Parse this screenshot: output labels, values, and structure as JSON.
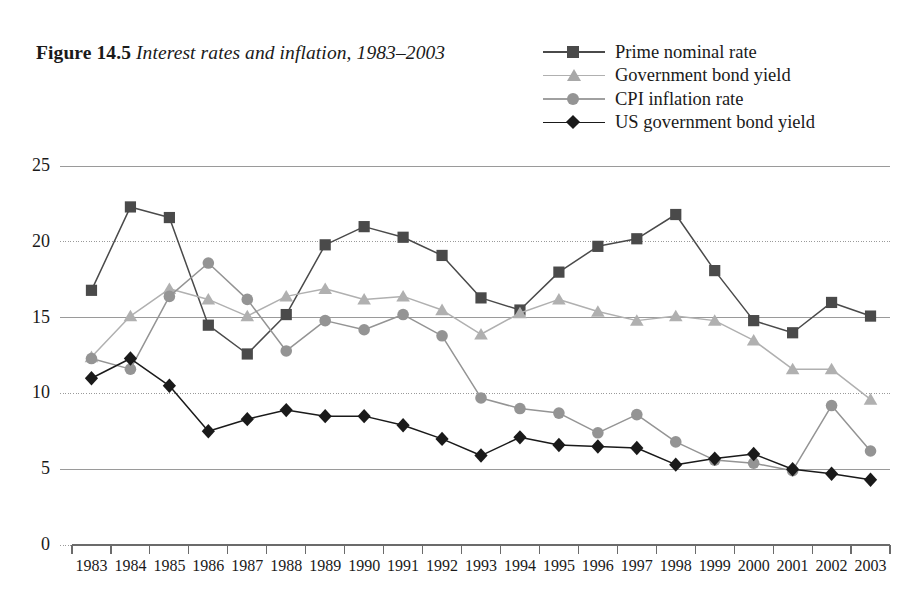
{
  "figure": {
    "number": "Figure 14.5",
    "caption": "Interest rates and inflation, 1983–2003"
  },
  "colors": {
    "prime_nominal_rate": "#4a4a4a",
    "government_bond_yield": "#b0b0b0",
    "cpi_inflation_rate": "#949494",
    "us_government_bond_yield": "#1a1a1a",
    "axis": "#6b6b6b",
    "gridline": "#9a9a9a",
    "background": "#ffffff",
    "text": "#1a1a1a"
  },
  "legend": {
    "position": "top-right",
    "entries": [
      {
        "label": "Prime nominal rate",
        "marker": "square",
        "color": "#4a4a4a"
      },
      {
        "label": "Government bond yield",
        "marker": "triangle",
        "color": "#b0b0b0"
      },
      {
        "label": "CPI inflation rate",
        "marker": "circle",
        "color": "#949494"
      },
      {
        "label": "US government bond yield",
        "marker": "diamond",
        "color": "#1a1a1a"
      }
    ]
  },
  "chart_data": {
    "type": "line",
    "xlabel": "",
    "ylabel": "",
    "grid": true,
    "legend_position": "top-right",
    "xlim": [
      1983,
      2003
    ],
    "ylim": [
      0,
      25
    ],
    "ytick_values": [
      0,
      5,
      10,
      15,
      20,
      25
    ],
    "ytick_labels": [
      "0",
      "5",
      "10",
      "15",
      "20",
      "25"
    ],
    "categories": [
      "1983",
      "1984",
      "1985",
      "1986",
      "1987",
      "1988",
      "1989",
      "1990",
      "1991",
      "1992",
      "1993",
      "1994",
      "1995",
      "1996",
      "1997",
      "1998",
      "1999",
      "2000",
      "2001",
      "2002",
      "2003"
    ],
    "series": [
      {
        "name": "Prime nominal rate",
        "marker": "square",
        "color": "#4a4a4a",
        "values": [
          16.8,
          22.3,
          21.6,
          14.5,
          12.6,
          15.2,
          19.8,
          21.0,
          20.3,
          19.1,
          16.3,
          15.5,
          18.0,
          19.7,
          20.2,
          21.8,
          18.1,
          14.8,
          14.0,
          16.0,
          15.1
        ]
      },
      {
        "name": "Government bond yield",
        "marker": "triangle",
        "color": "#b0b0b0",
        "values": [
          12.4,
          15.1,
          16.9,
          16.2,
          15.1,
          16.4,
          16.9,
          16.2,
          16.4,
          15.5,
          13.9,
          15.3,
          16.2,
          15.4,
          14.8,
          15.1,
          14.8,
          13.5,
          11.6,
          11.6,
          9.6
        ]
      },
      {
        "name": "CPI inflation rate",
        "marker": "circle",
        "color": "#949494",
        "values": [
          12.3,
          11.6,
          16.4,
          18.6,
          16.2,
          12.8,
          14.8,
          14.2,
          15.2,
          13.8,
          9.7,
          9.0,
          8.7,
          7.4,
          8.6,
          6.8,
          5.6,
          5.4,
          4.9,
          9.2,
          6.2
        ]
      },
      {
        "name": "US government bond yield",
        "marker": "diamond",
        "color": "#1a1a1a",
        "values": [
          11.0,
          12.3,
          10.5,
          7.5,
          8.3,
          8.9,
          8.5,
          8.5,
          7.9,
          7.0,
          5.9,
          7.1,
          6.6,
          6.5,
          6.4,
          5.3,
          5.7,
          6.0,
          5.0,
          4.7,
          4.3
        ]
      }
    ]
  }
}
